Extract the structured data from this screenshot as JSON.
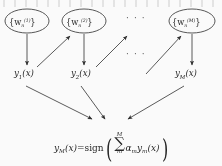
{
  "figure": {
    "name": "boosting-ensemble-diagram",
    "background_color": "#fdfdfd",
    "ink_color": "#222222",
    "width": 222,
    "height": 166
  },
  "weight_nodes": [
    {
      "id": "w1",
      "text": "{w",
      "sub": "n",
      "sup": "(1)",
      "close": "}",
      "cx": 27,
      "cy": 21,
      "rx": 22,
      "ry": 12
    },
    {
      "id": "w2",
      "text": "{w",
      "sub": "n",
      "sup": "(2)",
      "close": "}",
      "cx": 84,
      "cy": 21,
      "rx": 22,
      "ry": 12
    },
    {
      "id": "wM",
      "text": "{w",
      "sub": "n",
      "sup": "(M)",
      "close": "}",
      "cx": 192,
      "cy": 21,
      "rx": 23,
      "ry": 12
    }
  ],
  "node_ellipsis": {
    "text": "· · ·",
    "x": 132,
    "y": 16
  },
  "middle_ellipsis": {
    "text": "· · ·",
    "x": 132,
    "y": 53
  },
  "outputs": [
    {
      "id": "y1",
      "base": "y",
      "sub": "1",
      "arg": "(x)",
      "x": 14,
      "y": 75
    },
    {
      "id": "y2",
      "base": "y",
      "sub": "2",
      "arg": "(x)",
      "x": 71,
      "y": 75
    },
    {
      "id": "yM",
      "base": "y",
      "sub": "M",
      "arg": "(x)",
      "x": 176,
      "y": 75
    }
  ],
  "formula": {
    "lhs_base": "y",
    "lhs_sub": "M",
    "lhs_arg": "(x)",
    "equals": "=",
    "func": "sign",
    "open_paren": "(",
    "sum_upper": "M",
    "sum_symbol": "∑",
    "sum_lower": "m",
    "coef_base": "α",
    "coef_sub": "m",
    "term_base": "y",
    "term_sub": "m",
    "term_arg": "(x)",
    "close_paren": ")",
    "x": 54,
    "y": 139
  },
  "arrows": {
    "description": "vertical arrows from weight nodes down to classifier outputs; diagonal arrows chaining each output up to the next weight node; three arrows converging onto the final combination formula",
    "down": [
      {
        "from": "w1",
        "to": "y1",
        "x1": 27,
        "y1": 34,
        "x2": 27,
        "y2": 66
      },
      {
        "from": "w2",
        "to": "y2",
        "x1": 84,
        "y1": 34,
        "x2": 84,
        "y2": 66
      },
      {
        "from": "wM",
        "to": "yM",
        "x1": 192,
        "y1": 34,
        "x2": 192,
        "y2": 66
      }
    ],
    "chain": [
      {
        "from": "y1",
        "to": "w2",
        "x1": 37,
        "y1": 66,
        "x2": 69,
        "y2": 35
      },
      {
        "from": "y2",
        "to": "next",
        "x1": 95,
        "y1": 66,
        "x2": 125,
        "y2": 35
      },
      {
        "from": "prev",
        "to": "wM",
        "x1": 145,
        "y1": 73,
        "x2": 180,
        "y2": 35
      }
    ],
    "converge": [
      {
        "from": "y1",
        "x1": 26,
        "y1": 85,
        "x2": 92,
        "y2": 118
      },
      {
        "from": "y2",
        "x1": 81,
        "y1": 85,
        "x2": 104,
        "y2": 118
      },
      {
        "from": "yM",
        "x1": 183,
        "y1": 85,
        "x2": 127,
        "y2": 118
      }
    ]
  }
}
